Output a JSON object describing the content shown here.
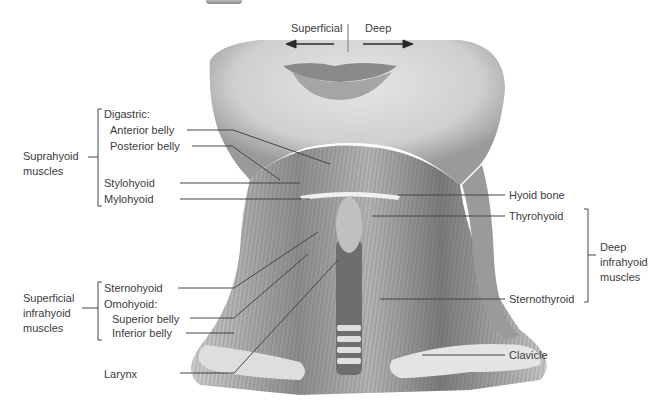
{
  "orientation": {
    "left_label": "Superficial",
    "right_label": "Deep"
  },
  "groups": {
    "suprahyoid": "Suprahyoid muscles",
    "superficial_infrahyoid": "Superficial infrahyoid muscles",
    "deep_infrahyoid": "Deep infrahyoid muscles"
  },
  "labels_left": {
    "digastric": "Digastric:",
    "anterior_belly": "Anterior belly",
    "posterior_belly": "Posterior belly",
    "stylohyoid": "Stylohyoid",
    "mylohyoid": "Mylohyoid",
    "sternohyoid": "Sternohyoid",
    "omohyoid": "Omohyoid:",
    "superior_belly": "Superior belly",
    "inferior_belly": "Inferior belly",
    "larynx": "Larynx"
  },
  "labels_right": {
    "hyoid_bone": "Hyoid bone",
    "thyrohyoid": "Thyrohyoid",
    "sternothyroid": "Sternothyroid",
    "clavicle": "Clavicle"
  },
  "colors": {
    "leader_line": "#444444",
    "text": "#3c3c3c",
    "skin": "#d9d9d9",
    "muscle_dark": "#6e6e6e"
  }
}
